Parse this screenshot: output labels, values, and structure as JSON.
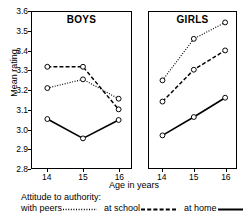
{
  "chart_data": {
    "type": "line",
    "title": "",
    "xlabel": "Age in years",
    "ylabel": "Mean rating",
    "x": [
      14,
      15,
      16
    ],
    "xticklabels": [
      "14",
      "15",
      "16"
    ],
    "ylim": [
      2.8,
      3.6
    ],
    "yticks": [
      2.8,
      2.9,
      3.0,
      3.1,
      3.2,
      3.3,
      3.4,
      3.5,
      3.6
    ],
    "yticklabels": [
      "2.8",
      "2.9",
      "3.0",
      "3.1",
      "3.2",
      "3.3",
      "3.4",
      "3.5",
      "3.6"
    ],
    "grid": false,
    "legend_position": "bottom",
    "legend_title": "Attitude to authority:",
    "panels": [
      {
        "title": "BOYS",
        "series": [
          {
            "name": "with peers",
            "style": "dotted",
            "values": [
              3.21,
              3.255,
              3.155
            ]
          },
          {
            "name": "at school",
            "style": "dashed",
            "values": [
              3.32,
              3.32,
              3.1
            ]
          },
          {
            "name": "at home",
            "style": "solid",
            "values": [
              3.05,
              2.95,
              3.045
            ]
          }
        ]
      },
      {
        "title": "GIRLS",
        "series": [
          {
            "name": "with peers",
            "style": "dotted",
            "values": [
              3.25,
              3.465,
              3.55
            ]
          },
          {
            "name": "at school",
            "style": "dashed",
            "values": [
              3.14,
              3.305,
              3.405
            ]
          },
          {
            "name": "at home",
            "style": "solid",
            "values": [
              2.965,
              3.06,
              3.16
            ]
          }
        ]
      }
    ],
    "legend": [
      {
        "label": "with peers",
        "style": "dotted"
      },
      {
        "label": "at school",
        "style": "dashed"
      },
      {
        "label": "at home",
        "style": "solid"
      }
    ],
    "line_color": "#000000",
    "marker": "open-circle"
  }
}
